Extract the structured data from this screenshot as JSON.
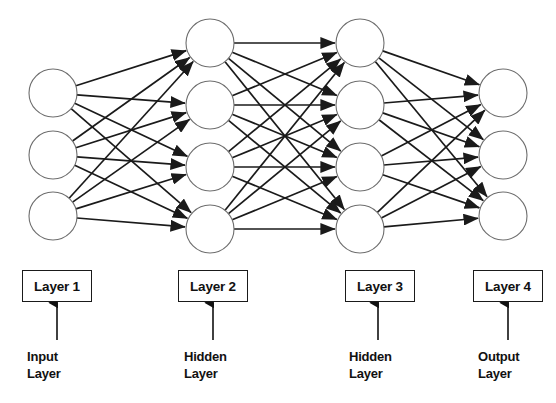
{
  "diagram": {
    "background_color": "#ffffff",
    "edge_color": "#1a1a1a",
    "node_stroke_color": "#6e6e6e",
    "node_fill_color": "#ffffff",
    "text_color": "#111111"
  },
  "layers": [
    {
      "id": "layer-1",
      "box_label": "Layer 1",
      "role_line1": "Input",
      "role_line2": "Layer",
      "node_count": 3,
      "center_x": 53,
      "node_radius": 24,
      "node_y": [
        93,
        155,
        216
      ],
      "box": {
        "x": 22,
        "y": 270,
        "w": 70,
        "h": 32
      },
      "pointer": {
        "x": 57,
        "y_top": 303,
        "y_bottom": 340
      },
      "role_text": {
        "x": 27,
        "y": 348
      }
    },
    {
      "id": "layer-2",
      "box_label": "Layer 2",
      "role_line1": "Hidden",
      "role_line2": "Layer",
      "node_count": 4,
      "center_x": 210,
      "node_radius": 24,
      "node_y": [
        43,
        105,
        167,
        229
      ],
      "box": {
        "x": 178,
        "y": 270,
        "w": 70,
        "h": 32
      },
      "pointer": {
        "x": 213,
        "y_top": 303,
        "y_bottom": 340
      },
      "role_text": {
        "x": 184,
        "y": 348
      }
    },
    {
      "id": "layer-3",
      "box_label": "Layer 3",
      "role_line1": "Hidden",
      "role_line2": "Layer",
      "node_count": 4,
      "center_x": 360,
      "node_radius": 24,
      "node_y": [
        43,
        105,
        167,
        229
      ],
      "box": {
        "x": 345,
        "y": 270,
        "w": 70,
        "h": 32
      },
      "pointer": {
        "x": 378,
        "y_top": 303,
        "y_bottom": 340
      },
      "role_text": {
        "x": 349,
        "y": 348
      }
    },
    {
      "id": "layer-4",
      "box_label": "Layer 4",
      "role_line1": "Output",
      "role_line2": "Layer",
      "node_count": 3,
      "center_x": 503,
      "node_radius": 24,
      "node_y": [
        93,
        155,
        216
      ],
      "box": {
        "x": 473,
        "y": 270,
        "w": 70,
        "h": 32
      },
      "pointer": {
        "x": 508,
        "y_top": 303,
        "y_bottom": 340
      },
      "role_text": {
        "x": 478,
        "y": 348
      }
    }
  ],
  "connections": [
    {
      "from": "layer-1",
      "to": "layer-2",
      "type": "fully-connected",
      "directed": true
    },
    {
      "from": "layer-2",
      "to": "layer-3",
      "type": "fully-connected",
      "directed": true
    },
    {
      "from": "layer-3",
      "to": "layer-4",
      "type": "fully-connected",
      "directed": true
    }
  ]
}
